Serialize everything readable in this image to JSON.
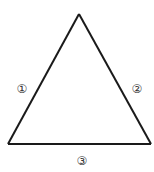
{
  "diagram": {
    "shape": "triangle",
    "stroke_color": "#1a1a1a",
    "vertices": {
      "apex": [
        79,
        14
      ],
      "bottom_left": [
        8,
        144
      ],
      "bottom_right": [
        151,
        144
      ]
    },
    "sides": [
      {
        "id": "left-side",
        "label": "①"
      },
      {
        "id": "right-side",
        "label": "②"
      },
      {
        "id": "bottom-side",
        "label": "③"
      }
    ]
  }
}
